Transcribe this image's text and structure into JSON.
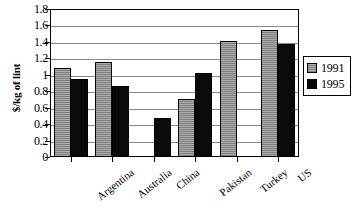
{
  "chart_data": {
    "type": "bar",
    "title": "",
    "xlabel": "",
    "ylabel": "$/kg of lint",
    "ylim": [
      0,
      1.8
    ],
    "ytick_labels": [
      "1.8",
      "1.6",
      "1.4",
      "1.2",
      "1",
      "0.8",
      "0.6",
      "0.4",
      "0.2",
      "0"
    ],
    "ytick_values": [
      1.8,
      1.6,
      1.4,
      1.2,
      1.0,
      0.8,
      0.6,
      0.4,
      0.2,
      0
    ],
    "grid": true,
    "grid_axis": "y",
    "legend_position": "right",
    "categories": [
      "Argentina",
      "Australia",
      "China",
      "Pakistan",
      "Turkey",
      "US"
    ],
    "series": [
      {
        "name": "1991",
        "color": "#8d8d8d",
        "values": [
          1.08,
          1.16,
          null,
          0.71,
          1.41,
          1.54
        ]
      },
      {
        "name": "1995",
        "color": "#000000",
        "values": [
          0.95,
          0.86,
          0.47,
          1.02,
          null,
          1.38
        ]
      }
    ]
  },
  "legend": {
    "items": [
      {
        "label": "1991"
      },
      {
        "label": "1995"
      }
    ]
  }
}
